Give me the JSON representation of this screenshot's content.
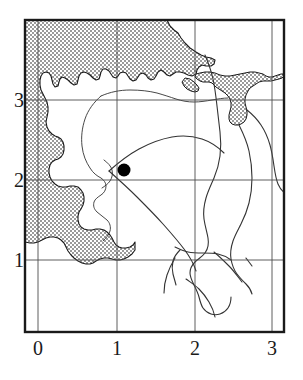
{
  "figure": {
    "type": "map",
    "background_color": "#ffffff",
    "frame_color": "#1a1a1a",
    "gridline_color": "#4d4d4d",
    "sea_fill_color": "#b8b8b8",
    "coastline_color": "#1a1a1a",
    "river_color": "#333333",
    "marker_color": "#000000"
  },
  "axes": {
    "x": {
      "ticks": [
        {
          "label": "0",
          "value": 0,
          "px": 38
        },
        {
          "label": "1",
          "value": 1,
          "px": 117
        },
        {
          "label": "2",
          "value": 2,
          "px": 195
        },
        {
          "label": "3",
          "value": 3,
          "px": 272
        }
      ],
      "range": [
        -0.17,
        3.13
      ],
      "title": ""
    },
    "y": {
      "ticks": [
        {
          "label": "1",
          "value": 1,
          "px": 260
        },
        {
          "label": "2",
          "value": 2,
          "px": 180
        },
        {
          "label": "3",
          "value": 3,
          "px": 100
        }
      ],
      "range": [
        0.1,
        4.0
      ],
      "title": ""
    },
    "grid": true,
    "frame": {
      "left_px": 25,
      "top_px": 20,
      "right_px": 284,
      "bottom_px": 332
    }
  },
  "markers": [
    {
      "name": "site-marker",
      "shape": "filled-circle",
      "x": 1.1,
      "y": 2.12,
      "px": 124,
      "py": 170,
      "radius_px": 6.5,
      "color": "#000000",
      "label": ""
    }
  ],
  "legend": {
    "visible": false,
    "entries": []
  },
  "annotations": []
}
